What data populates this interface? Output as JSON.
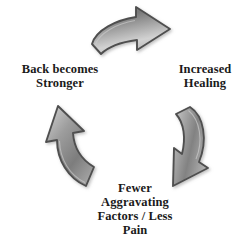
{
  "diagram": {
    "background_color": "#ffffff",
    "text_color": "#1a1a1a",
    "arrow_colors": {
      "outline": "#4a4a4a",
      "fill_light": "#d8d8d8",
      "fill_mid": "#9a9a9a",
      "fill_dark": "#6e6e6e",
      "shadow": "#b8b8b8"
    },
    "labels": {
      "back_becomes_stronger": {
        "line1": "Back becomes",
        "line2": "Stronger"
      },
      "increased_healing": {
        "line1": "Increased",
        "line2": "Healing"
      },
      "fewer_aggravating": {
        "line1": "Fewer",
        "line2": "Aggravating",
        "line3": "Factors / Less",
        "line4": "Pain"
      }
    },
    "arrows": {
      "top": "arrow-top-right",
      "right": "arrow-curved-down-left",
      "left": "arrow-curved-up-left"
    }
  }
}
